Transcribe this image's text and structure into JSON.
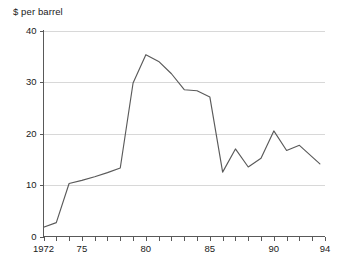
{
  "chart_data": {
    "type": "line",
    "title": "",
    "subtitle": "",
    "ylabel": "$ per barrel",
    "xlabel": "",
    "ylim": [
      0,
      40
    ],
    "xlim": [
      1972,
      1994
    ],
    "yticks": [
      0,
      10,
      20,
      30,
      40
    ],
    "ytick_labels": [
      "0",
      "10",
      "20",
      "30",
      "40"
    ],
    "xticks": [
      1972,
      1973,
      1974,
      1975,
      1976,
      1977,
      1978,
      1979,
      1980,
      1981,
      1982,
      1983,
      1984,
      1985,
      1986,
      1987,
      1988,
      1989,
      1990,
      1991,
      1992,
      1993,
      1994
    ],
    "xtick_labels": {
      "1972": "1972",
      "1975": "75",
      "1980": "80",
      "1985": "85",
      "1990": "90",
      "1994": "94"
    },
    "grid": "horizontal",
    "legend": "none",
    "x": [
      1972,
      1973,
      1974,
      1975,
      1976,
      1977,
      1978,
      1979,
      1980,
      1981,
      1982,
      1983,
      1984,
      1985,
      1986,
      1987,
      1988,
      1989,
      1990,
      1991,
      1992,
      1993.6
    ],
    "series": [
      {
        "name": "$ per barrel",
        "color": "#5a5a5a",
        "values": [
          1.8,
          2.7,
          10.3,
          10.9,
          11.6,
          12.4,
          13.3,
          29.8,
          35.3,
          34.0,
          31.6,
          28.5,
          28.3,
          27.1,
          12.5,
          17.0,
          13.5,
          15.2,
          20.5,
          16.7,
          17.7,
          14.1
        ]
      }
    ]
  },
  "axis": {
    "y_label_text": "$ per barrel"
  }
}
